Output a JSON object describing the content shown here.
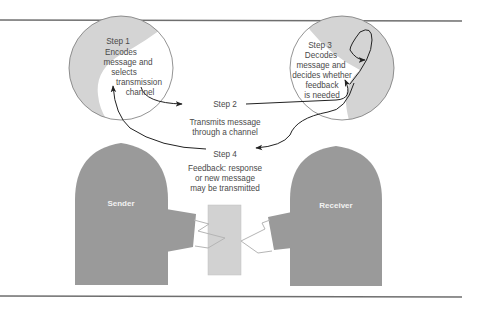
{
  "diagram": {
    "colors": {
      "body": "#9a9a9a",
      "head_shade": "#d4d4d4",
      "head_fill": "#ffffff",
      "message": "#d2d2d2",
      "line": "#333333",
      "text": "#4a4a4a",
      "rule": "#6e6e6e"
    },
    "sender": {
      "label": "Sender",
      "step": "Step 1",
      "desc": [
        "Encodes",
        "message and",
        "selects",
        "transmission",
        "channel"
      ]
    },
    "receiver": {
      "label": "Receiver",
      "step": "Step 3",
      "desc": [
        "Decodes",
        "message and",
        "decides whether",
        "feedback",
        "is needed"
      ]
    },
    "step2": {
      "label": "Step 2",
      "desc": [
        "Transmits message",
        "through a channel"
      ]
    },
    "step4": {
      "label": "Step 4",
      "desc": [
        "Feedback: response",
        "or new message",
        "may be transmitted"
      ]
    },
    "message_icon": "message-rectangle"
  }
}
